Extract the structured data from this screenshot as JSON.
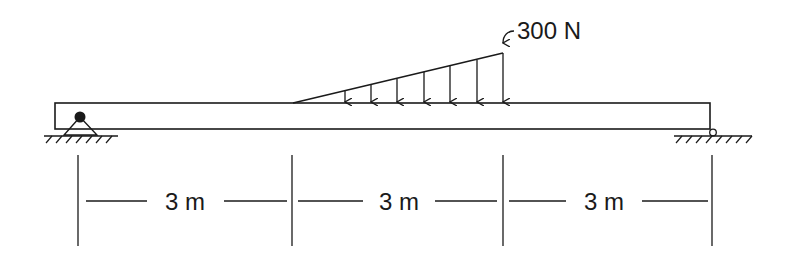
{
  "diagram": {
    "type": "simply supported beam with linearly varying distributed load",
    "beam": {
      "x_start": 55,
      "x_end": 710,
      "y_top": 103,
      "y_bottom": 129
    },
    "supports": [
      {
        "name": "pin-support",
        "type": "pin",
        "x": 80
      },
      {
        "name": "roller-support",
        "type": "roller",
        "x": 712
      }
    ],
    "load": {
      "type": "triangular distributed load",
      "label": "300 N",
      "x_start": 293,
      "x_end": 503,
      "peak_y": 53,
      "arrow_xs": [
        345,
        371,
        397,
        424,
        450,
        477,
        503
      ]
    },
    "dimensions": {
      "ticks_x": [
        78,
        292,
        503,
        712
      ],
      "segments": [
        {
          "label": "3 m"
        },
        {
          "label": "3 m"
        },
        {
          "label": "3 m"
        }
      ]
    },
    "colors": {
      "line": "#1a1a1a",
      "background": "#ffffff"
    }
  }
}
